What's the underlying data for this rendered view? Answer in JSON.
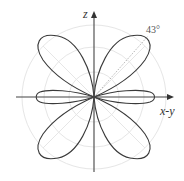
{
  "diagram": {
    "type": "polar radiation pattern",
    "axes": {
      "vertical_label": "z",
      "horizontal_label": "x-y"
    },
    "annotation": {
      "angle_label": "43°",
      "angle_degrees": 43
    },
    "lobes": [
      {
        "name": "upper-right",
        "direction_deg": 43
      },
      {
        "name": "upper-left",
        "direction_deg": 137
      },
      {
        "name": "lower-left",
        "direction_deg": 223
      },
      {
        "name": "lower-right",
        "direction_deg": 317
      },
      {
        "name": "right-minor",
        "direction_deg": 0
      },
      {
        "name": "left-minor",
        "direction_deg": 180
      }
    ],
    "colors": {
      "curve": "#3a3a3a",
      "axis": "#444444",
      "grid": "#e4e4e4",
      "dotted_line": "#9a9a9a"
    }
  }
}
